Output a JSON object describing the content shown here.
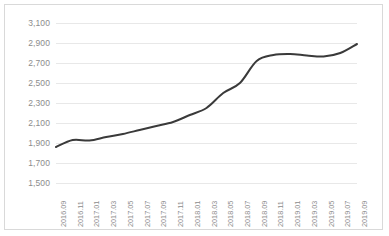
{
  "chart_data": {
    "type": "line",
    "title": "",
    "subtitle": "",
    "xlabel": "",
    "ylabel": "",
    "grid": true,
    "legend": false,
    "legend_position": "none",
    "line_color": "#3a3a3a",
    "background_color": "#ffffff",
    "gridline_color": "#e8e8e8",
    "border_color": "#d9d9d9",
    "axis_label_color": "#8c8c8c",
    "ylim": [
      1500,
      3100
    ],
    "ytick_step": 200,
    "ytick_labels": [
      "3,100",
      "2,900",
      "2,700",
      "2,500",
      "2,300",
      "2,100",
      "1,900",
      "1,700",
      "1,500"
    ],
    "yticks": [
      3100,
      2900,
      2700,
      2500,
      2300,
      2100,
      1900,
      1700,
      1500
    ],
    "categories": [
      "2016.09",
      "2016.11",
      "2017.01",
      "2017.03",
      "2017.05",
      "2017.07",
      "2017.09",
      "2017.11",
      "2018.01",
      "2018.03",
      "2018.05",
      "2018.07",
      "2018.09",
      "2018.11",
      "2019.01",
      "2019.03",
      "2019.05",
      "2019.07",
      "2019.09"
    ],
    "values": [
      1860,
      1930,
      1925,
      1960,
      1990,
      2030,
      2070,
      2110,
      2180,
      2250,
      2400,
      2500,
      2720,
      2780,
      2790,
      2775,
      2765,
      2800,
      2890
    ],
    "series": [
      {
        "name": "series-1",
        "values": [
          1860,
          1930,
          1925,
          1960,
          1990,
          2030,
          2070,
          2110,
          2180,
          2250,
          2400,
          2500,
          2720,
          2780,
          2790,
          2775,
          2765,
          2800,
          2890
        ]
      }
    ]
  }
}
